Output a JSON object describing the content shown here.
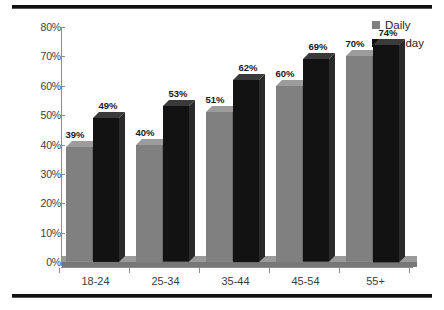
{
  "chart_data": {
    "type": "bar",
    "title": "",
    "subtitle": "",
    "xlabel": "",
    "ylabel": "",
    "categories": [
      "18-24",
      "25-34",
      "35-44",
      "45-54",
      "55+"
    ],
    "series": [
      {
        "name": "Daily",
        "color": "#808080",
        "values": [
          39,
          49,
          51,
          60,
          70
        ],
        "labels": [
          "39%",
          "51%",
          "60%",
          "70%"
        ]
      },
      {
        "name": "Sunday",
        "color": "#111111",
        "values": [
          49,
          53,
          62,
          69,
          74
        ],
        "labels": [
          "49%",
          "53%",
          "62%",
          "69%",
          "74%"
        ]
      }
    ],
    "series_values": {
      "Daily": [
        39,
        40,
        51,
        60,
        70
      ],
      "Sunday": [
        49,
        53,
        62,
        69,
        74
      ]
    },
    "data_labels": {
      "Daily": [
        "39%",
        "40%",
        "51%",
        "60%",
        "70%"
      ],
      "Sunday": [
        "49%",
        "53%",
        "62%",
        "69%",
        "74%"
      ]
    },
    "ylim": [
      0,
      80
    ],
    "ytick_values": [
      0,
      10,
      20,
      30,
      40,
      50,
      60,
      70,
      80
    ],
    "ytick_labels": [
      "0%",
      "10%",
      "20%",
      "30%",
      "40%",
      "50%",
      "60%",
      "70%",
      "80%"
    ],
    "grid": false,
    "legend_position": "top-right",
    "value_format": "percent",
    "three_d": true
  },
  "legend": {
    "items": [
      {
        "label": "Daily",
        "color": "#808080",
        "icon": "square-swatch-icon"
      },
      {
        "label": "Sunday",
        "color": "#111111",
        "icon": "square-swatch-icon"
      }
    ]
  },
  "axis": {
    "y_labels": [
      "80%",
      "70%",
      "60%",
      "50%",
      "40%",
      "30%",
      "20%",
      "10%",
      "0%"
    ],
    "x_labels": [
      "18-24",
      "25-34",
      "35-44",
      "45-54",
      "55+"
    ]
  },
  "labels": {
    "daily": [
      "39%",
      "40%",
      "51%",
      "60%",
      "70%"
    ],
    "sunday": [
      "49%",
      "53%",
      "62%",
      "69%",
      "74%"
    ]
  },
  "colors": {
    "daily_fill": "#808080",
    "daily_side": "#6a6a6a",
    "daily_cap": "#9c9c9c",
    "sunday_fill": "#121212",
    "sunday_side": "#2a2a2a",
    "sunday_cap": "#3a3a3a",
    "axis": "#8c8c8c",
    "text": "#3d3d3d",
    "rule": "#111111",
    "background": "#ffffff"
  }
}
